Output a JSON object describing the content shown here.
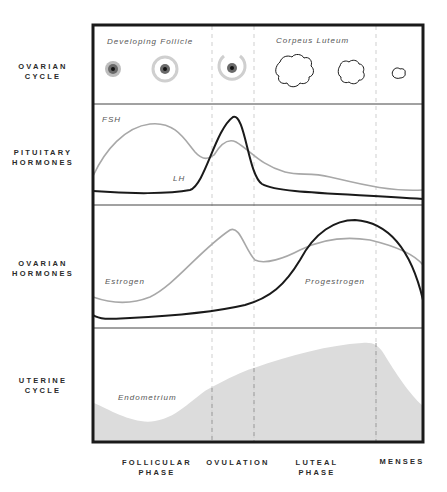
{
  "rows": [
    {
      "line1": "OVARIAN",
      "line2": "CYCLE"
    },
    {
      "line1": "PITUITARY",
      "line2": "HORMONES"
    },
    {
      "line1": "OVARIAN",
      "line2": "HORMONES"
    },
    {
      "line1": "UTERINE",
      "line2": "CYCLE"
    }
  ],
  "phases": [
    {
      "line1": "FOLLICULAR",
      "line2": "PHASE"
    },
    {
      "line1": "OVULATION",
      "line2": ""
    },
    {
      "line1": "LUTEAL",
      "line2": "PHASE"
    },
    {
      "line1": "MENSES",
      "line2": ""
    }
  ],
  "ovarian_cycle": {
    "developing_follicle_label": "Developing Follicle",
    "corpus_luteum_label": "Corpeus Luteum"
  },
  "pituitary": {
    "fsh_label": "FSH",
    "lh_label": "LH"
  },
  "ovarian_hormones": {
    "estrogen_label": "Estrogen",
    "progesterone_label": "Progestrogen"
  },
  "uterine": {
    "endometrium_label": "Endometrium"
  },
  "colors": {
    "frame": "#1a1a1a",
    "gray_curve": "#a8a8a8",
    "black_curve": "#1a1a1a",
    "endometrium_fill": "#dcdcdc"
  }
}
